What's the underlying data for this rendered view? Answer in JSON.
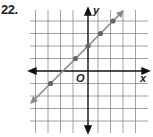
{
  "problem": {
    "number": "22."
  },
  "graph": {
    "x_axis_label": "x",
    "y_axis_label": "y",
    "origin_label": "O",
    "grid": {
      "x_min": -5,
      "x_max": 4,
      "y_min": -4,
      "y_max": 5,
      "spacing_px": 12.5
    },
    "line": {
      "equation": "y = x + 2",
      "slope": 1,
      "y_intercept": 2,
      "color": "#888888"
    },
    "points": [
      {
        "x": -3,
        "y": -1
      },
      {
        "x": -1,
        "y": 1
      },
      {
        "x": 0,
        "y": 2
      },
      {
        "x": 1,
        "y": 3
      },
      {
        "x": 2,
        "y": 4
      }
    ],
    "colors": {
      "grid": "#888888",
      "axes": "#111111",
      "points": "#666666"
    }
  }
}
